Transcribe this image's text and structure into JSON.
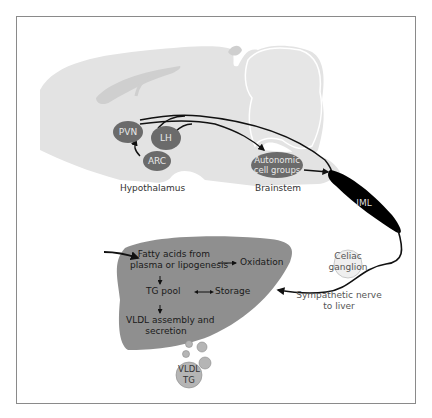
{
  "diagram": {
    "type": "neural-liver pathway schematic",
    "colors": {
      "brain_fill": "#e3e3e3",
      "brain_ventricle": "#cfcfcf",
      "node_fill": "#6b6b6b",
      "iml_fill": "#000000",
      "liver_fill": "#8f8f8f",
      "ganglion_fill": "#efefef",
      "vesicle_fill": "#b5b5b5",
      "frame_border": "#8a8a8a"
    },
    "brain_nodes": {
      "pvn": "PVN",
      "lh": "LH",
      "arc": "ARC",
      "autonomic_line1": "Autonomic",
      "autonomic_line2": "cell groups",
      "iml": "IML"
    },
    "region_labels": {
      "hypothalamus": "Hypothalamus",
      "brainstem": "Brainstem"
    },
    "ganglion": {
      "line1": "Celiac",
      "line2": "ganglion"
    },
    "nerve_label": {
      "line1": "Sympathetic nerve",
      "line2": "to liver"
    },
    "liver": {
      "fatty_line1": "Fatty acids from",
      "fatty_line2": "plasma or lipogenesis",
      "oxidation": "Oxidation",
      "tg_pool": "TG pool",
      "storage": "Storage",
      "vldl_line1": "VLDL assembly and",
      "vldl_line2": "secretion"
    },
    "vldl_particle": {
      "line1": "VLDL",
      "line2": "TG"
    }
  }
}
